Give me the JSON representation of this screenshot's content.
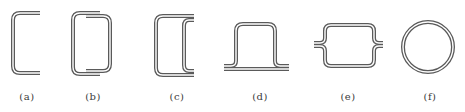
{
  "figure": {
    "panels": [
      {
        "id": "a",
        "label": "(a)",
        "shape": "open-channel-c-section"
      },
      {
        "id": "b",
        "label": "(b)",
        "shape": "overlapping-box-section"
      },
      {
        "id": "c",
        "label": "(c)",
        "shape": "double-c-section"
      },
      {
        "id": "d",
        "label": "(d)",
        "shape": "hat-section"
      },
      {
        "id": "e",
        "label": "(e)",
        "shape": "flanged-box-section"
      },
      {
        "id": "f",
        "label": "(f)",
        "shape": "circular-tube-section"
      }
    ],
    "colors": {
      "stroke": "#5a5a5a",
      "background": "#ffffff",
      "label": "#3a3a3a"
    }
  }
}
